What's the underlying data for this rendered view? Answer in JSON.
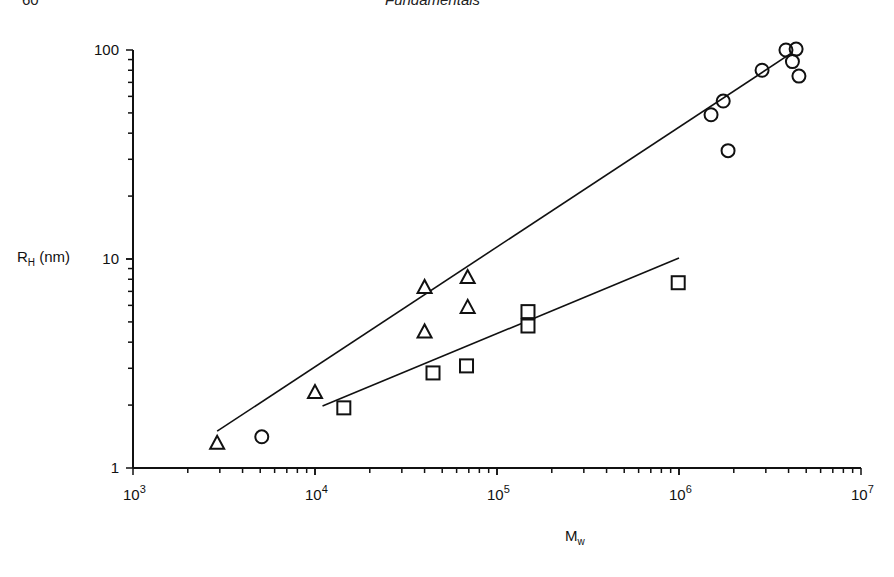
{
  "page": {
    "page_number": "60",
    "running_title": "Fundamentals"
  },
  "axes": {
    "ylabel_main": "R",
    "ylabel_sub": "H",
    "ylabel_unit": " (nm)",
    "xlabel_main": "M",
    "xlabel_sub": "w",
    "yticks": [
      "1",
      "10",
      "100"
    ],
    "xticks": [
      {
        "base": "10",
        "exp": "3"
      },
      {
        "base": "10",
        "exp": "4"
      },
      {
        "base": "10",
        "exp": "5"
      },
      {
        "base": "10",
        "exp": "6"
      },
      {
        "base": "10",
        "exp": "7"
      }
    ]
  },
  "chart_data": {
    "type": "scatter",
    "title": "",
    "xlabel": "M_w",
    "ylabel": "R_H (nm)",
    "xscale": "log",
    "yscale": "log",
    "xlim": [
      1000,
      10000000
    ],
    "ylim": [
      1,
      100
    ],
    "grid": false,
    "legend": null,
    "series": [
      {
        "name": "triangles",
        "marker": "triangle",
        "points": [
          {
            "x": 2900,
            "y": 1.32
          },
          {
            "x": 10000,
            "y": 2.31
          },
          {
            "x": 40000,
            "y": 7.35
          },
          {
            "x": 40000,
            "y": 4.5
          },
          {
            "x": 69000,
            "y": 8.2
          },
          {
            "x": 69000,
            "y": 5.9
          }
        ]
      },
      {
        "name": "circles",
        "marker": "circle",
        "points": [
          {
            "x": 5100,
            "y": 1.41
          },
          {
            "x": 1500000,
            "y": 49
          },
          {
            "x": 1750000,
            "y": 57
          },
          {
            "x": 1860000,
            "y": 33
          },
          {
            "x": 2860000,
            "y": 80
          },
          {
            "x": 3870000,
            "y": 100
          },
          {
            "x": 4400000,
            "y": 101
          },
          {
            "x": 4200000,
            "y": 88
          },
          {
            "x": 4560000,
            "y": 75
          }
        ]
      },
      {
        "name": "squares",
        "marker": "square",
        "points": [
          {
            "x": 14400,
            "y": 1.94
          },
          {
            "x": 44500,
            "y": 2.85
          },
          {
            "x": 68000,
            "y": 3.08
          },
          {
            "x": 148000,
            "y": 5.6
          },
          {
            "x": 148000,
            "y": 4.78
          },
          {
            "x": 990000,
            "y": 7.7
          }
        ]
      }
    ],
    "fit_lines": [
      {
        "name": "upper fit (triangles + circles)",
        "from": {
          "x": 2900,
          "y": 1.5
        },
        "to": {
          "x": 4100000,
          "y": 96
        }
      },
      {
        "name": "lower fit (squares)",
        "from": {
          "x": 11000,
          "y": 1.98
        },
        "to": {
          "x": 1000000,
          "y": 10.1
        }
      }
    ]
  }
}
